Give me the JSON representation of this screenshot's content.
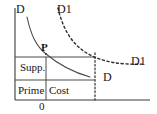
{
  "figure": {
    "kind": "economics-demand-supply-cost-diagram",
    "width": 157,
    "height": 114,
    "background_color": "#ffffff",
    "line_color": "#3a3a3a",
    "text_color": "#151515"
  },
  "axes": {
    "y_axis_name": "vertical-axis",
    "x_axis_name": "horizontal-axis",
    "origin_label": "0",
    "y_axis_top_label": "D",
    "y_axis_x": 15,
    "y_axis_top": 8,
    "x_axis_y": 100,
    "x_axis_right": 150
  },
  "curves": [
    {
      "id": "demand-d",
      "label": "D",
      "style": "solid",
      "label_position": "right-of-curve",
      "description": "original downward sloping demand curve through point P"
    },
    {
      "id": "demand-d1",
      "label": "D1",
      "style": "dashed",
      "label_position": "top-and-right",
      "description": "shifted outward demand curve, dashed"
    }
  ],
  "labels": {
    "d_axis": "D",
    "d1_top": "D1",
    "d1_right": "D1",
    "d_curve": "D",
    "point_p": "P",
    "supp": "Supp.",
    "prime": "Prime",
    "cost": "Cost",
    "origin": "0"
  },
  "blocks": [
    {
      "name": "supp-block",
      "label": "Supp.",
      "row": "upper"
    },
    {
      "name": "prime-block",
      "label": "Prime",
      "row": "lower"
    },
    {
      "name": "cost-block",
      "label": "Cost",
      "row": "lower"
    }
  ],
  "guides": {
    "price_line_name": "price-horizontal-guide",
    "quantity_line_name": "quantity-dotted-guide",
    "quantity_line_style": "dotted"
  }
}
